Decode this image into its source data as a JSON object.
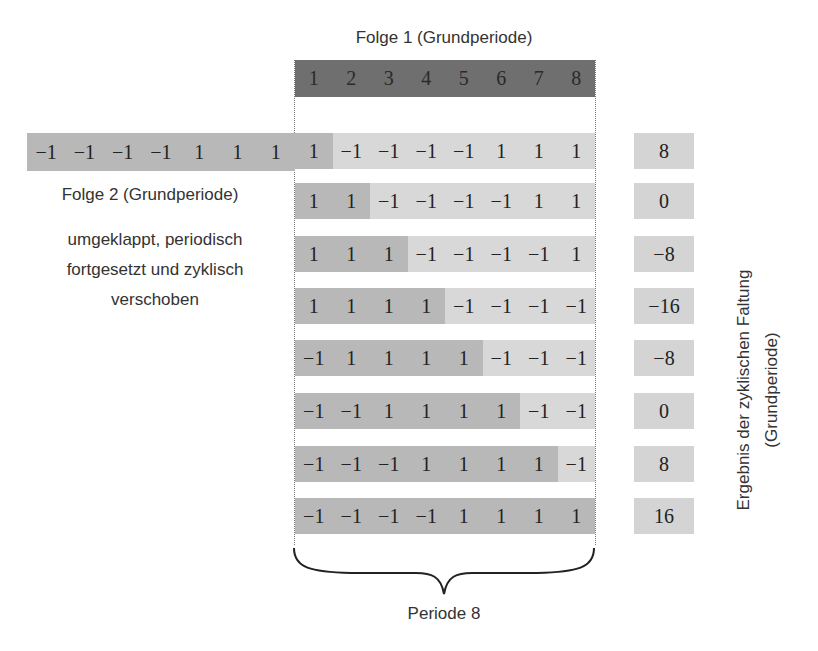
{
  "title_top": "Folge 1 (Grundperiode)",
  "header_indices": [
    "1",
    "2",
    "3",
    "4",
    "5",
    "6",
    "7",
    "8"
  ],
  "extension_row": [
    "−1",
    "−1",
    "−1",
    "−1",
    "1",
    "1",
    "1"
  ],
  "folge2_label": "Folge 2 (Grundperiode)",
  "folge2_desc": [
    "umgeklappt, periodisch",
    "fortgesetzt und zyklisch",
    "verschoben"
  ],
  "rows": [
    {
      "values": [
        "1",
        "−1",
        "−1",
        "−1",
        "−1",
        "1",
        "1",
        "1"
      ],
      "dark_count": 1,
      "result": "8"
    },
    {
      "values": [
        "1",
        "1",
        "−1",
        "−1",
        "−1",
        "−1",
        "1",
        "1"
      ],
      "dark_count": 2,
      "result": "0"
    },
    {
      "values": [
        "1",
        "1",
        "1",
        "−1",
        "−1",
        "−1",
        "−1",
        "1"
      ],
      "dark_count": 3,
      "result": "−8"
    },
    {
      "values": [
        "1",
        "1",
        "1",
        "1",
        "−1",
        "−1",
        "−1",
        "−1"
      ],
      "dark_count": 4,
      "result": "−16"
    },
    {
      "values": [
        "−1",
        "1",
        "1",
        "1",
        "1",
        "−1",
        "−1",
        "−1"
      ],
      "dark_count": 5,
      "result": "−8"
    },
    {
      "values": [
        "−1",
        "−1",
        "1",
        "1",
        "1",
        "1",
        "−1",
        "−1"
      ],
      "dark_count": 6,
      "result": "0"
    },
    {
      "values": [
        "−1",
        "−1",
        "−1",
        "1",
        "1",
        "1",
        "1",
        "−1"
      ],
      "dark_count": 7,
      "result": "8"
    },
    {
      "values": [
        "−1",
        "−1",
        "−1",
        "−1",
        "1",
        "1",
        "1",
        "1"
      ],
      "dark_count": 8,
      "result": "16"
    }
  ],
  "result_label": [
    "Ergebnis der zyklischen Faltung",
    "(Grundperiode)"
  ],
  "periode_label": "Periode 8",
  "colors": {
    "header": "#6f6f6f",
    "shifted_dark": "#b8b8b8",
    "shifted_light": "#d8d8d8",
    "result_box": "#d4d4d4"
  }
}
